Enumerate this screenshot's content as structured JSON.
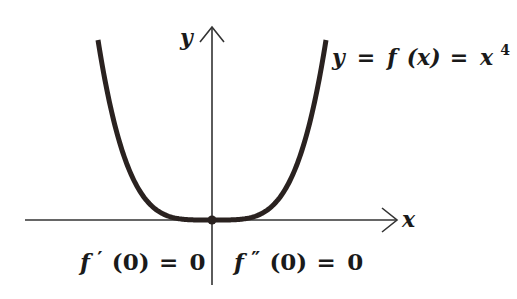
{
  "diagram": {
    "axes": {
      "x_label": "x",
      "y_label": "y"
    },
    "curve": {
      "function": "x^4",
      "label_parts": {
        "y": "y",
        "eq1": "=",
        "f": "f",
        "arg": "(x)",
        "eq2": "=",
        "base": "x",
        "exp": "4"
      },
      "color": "#2a2220"
    },
    "origin_point": {
      "label": "origin",
      "color": "#2a2220"
    },
    "annotations": {
      "first_derivative": {
        "f": "f",
        "prime": "′",
        "arg": "(0)",
        "eq": "=",
        "val": "0"
      },
      "second_derivative": {
        "f": "f",
        "prime": "″",
        "arg": "(0)",
        "eq": "=",
        "val": "0"
      }
    },
    "colors": {
      "axis": "#333333",
      "text": "#1a1a1a",
      "background": "#ffffff"
    }
  }
}
